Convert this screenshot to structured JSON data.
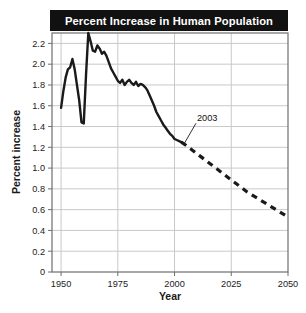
{
  "figure": {
    "title": "Percent Increase in Human Population",
    "title_bar_color": "#111111",
    "title_text_color": "#ffffff",
    "background_color": "#ffffff",
    "frame_color": "#6e6e6e",
    "grid_color": "#c9c9c9",
    "line_color": "#1a1a1a"
  },
  "chart_data": {
    "type": "line",
    "title": "Percent Increase in Human Population",
    "xlabel": "Year",
    "ylabel": "Percent increase",
    "xlim": [
      1946,
      2050
    ],
    "ylim": [
      0,
      2.3
    ],
    "xticks": [
      1950,
      1975,
      2000,
      2025,
      2050
    ],
    "xtick_labels": [
      "1950",
      "1975",
      "2000",
      "2025",
      "2050"
    ],
    "yticks": [
      0,
      0.2,
      0.4,
      0.6,
      0.8,
      1.0,
      1.2,
      1.4,
      1.6,
      1.8,
      2.0,
      2.2
    ],
    "ytick_labels": [
      "0",
      "0.2",
      "0.4",
      "0.6",
      "0.8",
      "1.0",
      "1.2",
      "1.4",
      "1.6",
      "1.8",
      "2.0",
      "2.2"
    ],
    "grid": true,
    "legend": false,
    "annotations": [
      {
        "label": "2003",
        "x": 2003,
        "y": 1.25,
        "text_x": 2009,
        "text_y": 1.45,
        "note": "marks end of observed data and start of projection"
      }
    ],
    "series": [
      {
        "name": "Observed percent increase",
        "style": "solid",
        "x": [
          1950,
          1951,
          1952,
          1953,
          1954,
          1955,
          1956,
          1957,
          1958,
          1959,
          1960,
          1961,
          1962,
          1963,
          1964,
          1965,
          1966,
          1967,
          1968,
          1969,
          1970,
          1971,
          1972,
          1973,
          1974,
          1975,
          1976,
          1977,
          1978,
          1979,
          1980,
          1981,
          1982,
          1983,
          1984,
          1985,
          1986,
          1987,
          1988,
          1989,
          1990,
          1991,
          1992,
          1993,
          1994,
          1995,
          1996,
          1997,
          1998,
          1999,
          2000,
          2001,
          2002,
          2003
        ],
        "y": [
          1.58,
          1.74,
          1.87,
          1.95,
          1.97,
          2.05,
          1.95,
          1.8,
          1.65,
          1.44,
          1.43,
          1.9,
          2.3,
          2.22,
          2.13,
          2.12,
          2.18,
          2.15,
          2.1,
          2.12,
          2.08,
          2.02,
          1.96,
          1.92,
          1.88,
          1.84,
          1.82,
          1.85,
          1.8,
          1.83,
          1.85,
          1.82,
          1.8,
          1.83,
          1.79,
          1.81,
          1.8,
          1.78,
          1.75,
          1.7,
          1.65,
          1.6,
          1.54,
          1.5,
          1.46,
          1.42,
          1.39,
          1.36,
          1.33,
          1.31,
          1.28,
          1.27,
          1.26,
          1.25
        ]
      },
      {
        "name": "Projected percent increase",
        "style": "dashed",
        "x": [
          2003,
          2005,
          2008,
          2011,
          2014,
          2017,
          2020,
          2023,
          2026,
          2029,
          2032,
          2035,
          2038,
          2041,
          2044,
          2047,
          2050
        ],
        "y": [
          1.25,
          1.22,
          1.17,
          1.12,
          1.07,
          1.02,
          0.97,
          0.92,
          0.87,
          0.82,
          0.77,
          0.73,
          0.69,
          0.65,
          0.61,
          0.57,
          0.53
        ]
      }
    ]
  }
}
